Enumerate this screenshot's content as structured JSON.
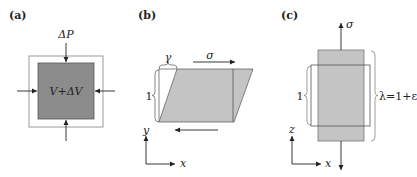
{
  "panels": {
    "a": {
      "label": "(a)",
      "pressure_label": "ΔP",
      "volume_label": "V+ΔV"
    },
    "b": {
      "label": "(b)",
      "shear_strain_label": "γ",
      "stress_label": "σ",
      "unit_length_label": "1",
      "axis_vertical_label": "y",
      "axis_horizontal_label": "x"
    },
    "c": {
      "label": "(c)",
      "stress_label": "σ",
      "unit_length_label": "1",
      "stretch_label": "λ=1+ε",
      "axis_vertical_label": "z",
      "axis_horizontal_label": "x"
    }
  },
  "colors": {
    "inner_fill": "#8c8c8c",
    "sheared_fill": "#c4c4c4",
    "stretched_fill": "#c4c4c4",
    "outline": "#555555",
    "light_outline": "#9a9a9a"
  }
}
